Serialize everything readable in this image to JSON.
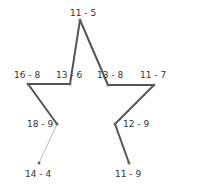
{
  "puzzle": {
    "type": "connect-the-dots",
    "colors": {
      "line": "#555555",
      "active_line": "#bbbbbb",
      "dot": "#666666",
      "label": "#333333"
    },
    "points": [
      {
        "label": "11 - 5",
        "x": 80,
        "y": 20,
        "lx": 70,
        "ly": 8
      },
      {
        "label": "13 - 6",
        "x": 70,
        "y": 84,
        "lx": 56,
        "ly": 70
      },
      {
        "label": "16 - 8",
        "x": 28,
        "y": 84,
        "lx": 14,
        "ly": 70
      },
      {
        "label": "18 - 9",
        "x": 57,
        "y": 124,
        "lx": 27,
        "ly": 119
      },
      {
        "label": "14 - 4",
        "x": 39,
        "y": 163,
        "lx": 25,
        "ly": 169
      },
      {
        "label": "13 - 8",
        "x": 108,
        "y": 85,
        "lx": 97,
        "ly": 70
      },
      {
        "label": "11 - 7",
        "x": 154,
        "y": 85,
        "lx": 140,
        "ly": 70
      },
      {
        "label": "12 - 9",
        "x": 115,
        "y": 124,
        "lx": 123,
        "ly": 119
      },
      {
        "label": "11 - 9",
        "x": 129,
        "y": 163,
        "lx": 115,
        "ly": 169
      }
    ],
    "segments": [
      {
        "from": 4,
        "to": 3,
        "style": "active"
      },
      {
        "from": 3,
        "to": 2,
        "style": "drawn"
      },
      {
        "from": 2,
        "to": 1,
        "style": "drawn"
      },
      {
        "from": 1,
        "to": 0,
        "style": "drawn"
      },
      {
        "from": 0,
        "to": 5,
        "style": "drawn"
      },
      {
        "from": 5,
        "to": 6,
        "style": "drawn"
      },
      {
        "from": 6,
        "to": 7,
        "style": "drawn"
      },
      {
        "from": 7,
        "to": 8,
        "style": "drawn"
      }
    ]
  }
}
